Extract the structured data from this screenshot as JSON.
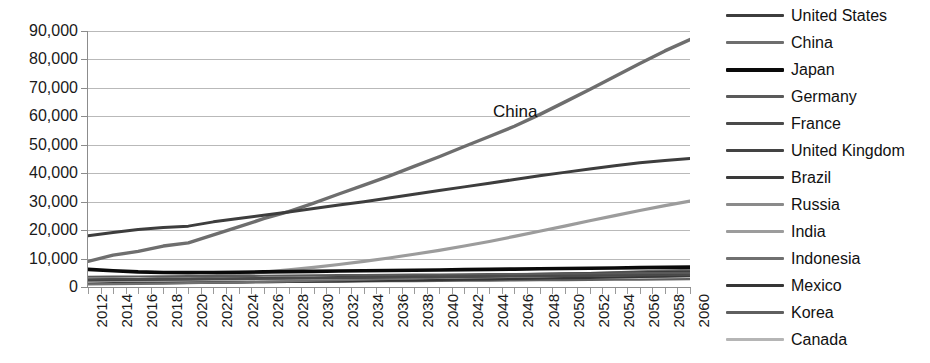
{
  "chart_data": {
    "type": "line",
    "title": "",
    "xlabel": "",
    "ylabel": "",
    "xlim": [
      2012,
      2060
    ],
    "ylim": [
      0,
      90000
    ],
    "ytick_step": 10000,
    "grid": true,
    "legend_position": "right",
    "annotations": [
      {
        "text": "China",
        "x": 2047,
        "y": 62000
      }
    ],
    "ytick_labels": [
      "90,000",
      "80,000",
      "70,000",
      "60,000",
      "50,000",
      "40,000",
      "30,000",
      "20,000",
      "10,000",
      "0"
    ],
    "ytick_values": [
      90000,
      80000,
      70000,
      60000,
      50000,
      40000,
      30000,
      20000,
      10000,
      0
    ],
    "xtick_labels": [
      "2012",
      "2014",
      "2016",
      "2018",
      "2020",
      "2022",
      "2024",
      "2026",
      "2028",
      "2030",
      "2032",
      "2034",
      "2036",
      "2038",
      "2040",
      "2042",
      "2044",
      "2046",
      "2048",
      "2050",
      "2052",
      "2054",
      "2056",
      "2058",
      "2060"
    ],
    "x": [
      2012,
      2014,
      2016,
      2018,
      2020,
      2022,
      2024,
      2026,
      2028,
      2030,
      2032,
      2034,
      2036,
      2038,
      2040,
      2042,
      2044,
      2046,
      2048,
      2050,
      2052,
      2054,
      2056,
      2058,
      2060
    ],
    "series": [
      {
        "name": "United States",
        "color": "#3d3d3d",
        "width": 3,
        "values": [
          18000,
          19200,
          20200,
          20900,
          21400,
          22900,
          24100,
          25200,
          26400,
          27600,
          28800,
          30000,
          31300,
          32600,
          33900,
          35200,
          36500,
          37800,
          39100,
          40300,
          41500,
          42600,
          43700,
          44500,
          45200
        ]
      },
      {
        "name": "China",
        "color": "#6e6e6e",
        "width": 3.4,
        "values": [
          9000,
          11200,
          12500,
          14400,
          15500,
          18300,
          21100,
          24000,
          26500,
          29500,
          32700,
          35800,
          39000,
          42400,
          45800,
          49400,
          52900,
          56500,
          60600,
          65000,
          69400,
          74000,
          78600,
          83000,
          87000
        ]
      },
      {
        "name": "Japan",
        "color": "#0a0a0a",
        "width": 3.6,
        "values": [
          6200,
          5700,
          5300,
          5100,
          5050,
          5100,
          5200,
          5300,
          5400,
          5500,
          5600,
          5700,
          5800,
          5900,
          6000,
          6100,
          6200,
          6300,
          6400,
          6500,
          6600,
          6700,
          6800,
          6900,
          7000
        ]
      },
      {
        "name": "Germany",
        "color": "#5a5a5a",
        "width": 2.2,
        "values": [
          3600,
          3650,
          3700,
          3750,
          3800,
          3850,
          3900,
          3960,
          4020,
          4080,
          4140,
          4200,
          4260,
          4320,
          4380,
          4440,
          4500,
          4560,
          4620,
          4680,
          4740,
          4800,
          4860,
          4920,
          4980
        ]
      },
      {
        "name": "France",
        "color": "#4a4a4a",
        "width": 2.2,
        "values": [
          2700,
          2740,
          2780,
          2830,
          2880,
          2930,
          2990,
          3050,
          3110,
          3170,
          3230,
          3290,
          3360,
          3430,
          3500,
          3570,
          3640,
          3710,
          3780,
          3850,
          3920,
          3990,
          4060,
          4130,
          4200
        ]
      },
      {
        "name": "United Kingdom",
        "color": "#434343",
        "width": 2.2,
        "values": [
          2500,
          2560,
          2620,
          2690,
          2760,
          2830,
          2910,
          2990,
          3070,
          3150,
          3240,
          3330,
          3420,
          3510,
          3600,
          3700,
          3800,
          3900,
          4000,
          4100,
          4200,
          4300,
          4400,
          4500,
          4600
        ]
      },
      {
        "name": "Brazil",
        "color": "#3a3a3a",
        "width": 2.2,
        "values": [
          2400,
          2480,
          2560,
          2660,
          2760,
          2870,
          2980,
          3100,
          3220,
          3340,
          3470,
          3600,
          3740,
          3880,
          4020,
          4160,
          4310,
          4460,
          4610,
          4760,
          4900,
          5040,
          5180,
          5320,
          5450
        ]
      },
      {
        "name": "Russia",
        "color": "#8a8a8a",
        "width": 2.2,
        "values": [
          2200,
          2280,
          2350,
          2430,
          2510,
          2590,
          2680,
          2770,
          2860,
          2950,
          3050,
          3150,
          3250,
          3350,
          3450,
          3560,
          3670,
          3780,
          3890,
          4000,
          4100,
          4200,
          4300,
          4400,
          4500
        ]
      },
      {
        "name": "India",
        "color": "#9c9c9c",
        "width": 3.2,
        "values": [
          2000,
          2300,
          2600,
          3000,
          3400,
          3900,
          4500,
          5200,
          6000,
          6900,
          7900,
          9000,
          10200,
          11500,
          12900,
          14400,
          16000,
          17800,
          19600,
          21400,
          23300,
          25100,
          26900,
          28600,
          30200
        ]
      },
      {
        "name": "Indonesia",
        "color": "#707070",
        "width": 2.2,
        "values": [
          900,
          1000,
          1100,
          1220,
          1350,
          1500,
          1650,
          1820,
          2000,
          2190,
          2390,
          2600,
          2820,
          3050,
          3290,
          3540,
          3800,
          4070,
          4340,
          4620,
          4900,
          5180,
          5460,
          5740,
          6000
        ]
      },
      {
        "name": "Mexico",
        "color": "#353535",
        "width": 2.2,
        "values": [
          1200,
          1260,
          1320,
          1390,
          1460,
          1540,
          1620,
          1710,
          1800,
          1900,
          2000,
          2110,
          2220,
          2340,
          2460,
          2580,
          2710,
          2840,
          2970,
          3100,
          3240,
          3380,
          3520,
          3660,
          3800
        ]
      },
      {
        "name": "Korea",
        "color": "#5f5f5f",
        "width": 2.2,
        "values": [
          1300,
          1360,
          1420,
          1480,
          1540,
          1600,
          1660,
          1720,
          1780,
          1840,
          1900,
          1960,
          2020,
          2080,
          2140,
          2200,
          2260,
          2320,
          2380,
          2440,
          2500,
          2560,
          2620,
          2680,
          2740
        ]
      },
      {
        "name": "Canada",
        "color": "#b5b5b5",
        "width": 2.4,
        "values": [
          1500,
          1560,
          1620,
          1690,
          1760,
          1840,
          1920,
          2000,
          2090,
          2180,
          2270,
          2370,
          2470,
          2570,
          2680,
          2790,
          2900,
          3010,
          3130,
          3250,
          3370,
          3490,
          3610,
          3730,
          3850
        ]
      }
    ]
  }
}
